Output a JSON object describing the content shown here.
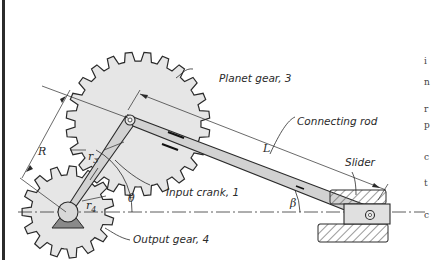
{
  "figure": {
    "type": "mechanism diagram"
  },
  "labels": {
    "planet_gear": "Planet gear, 3",
    "connecting_rod": "Connecting rod",
    "slider": "Slider",
    "input_crank": "Input crank, 1",
    "output_gear": "Output gear, 4"
  },
  "symbols": {
    "R": "R",
    "r3": "r",
    "r3_sub": "3",
    "r4": "r",
    "r4_sub": "4",
    "L": "L",
    "theta": "θ",
    "beta": "β"
  },
  "colors": {
    "gear_fill": "#e6e6e6",
    "crank_fill": "#d2d2d2",
    "line": "#2a2a2a",
    "hatch": "#555555",
    "background": "#ffffff"
  },
  "edge_text": [
    "i",
    "n",
    "r",
    "p",
    "c",
    "t",
    "c"
  ]
}
